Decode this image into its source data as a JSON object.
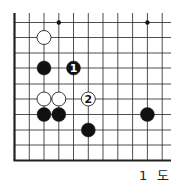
{
  "diagram": {
    "type": "go-board-fragment",
    "caption": "1 도",
    "grid": {
      "col_x": [
        14.5,
        29.3,
        44,
        58.8,
        73.5,
        88.3,
        103,
        117.8,
        132.6,
        147.4,
        162.2
      ],
      "row_y": [
        22.5,
        37.5,
        53,
        68,
        84,
        99,
        114.5,
        130,
        145,
        160.5
      ],
      "top_open_y": 13,
      "right_open_x": 171,
      "left_edge_x": 14.5,
      "bottom_edge_y": 160.5,
      "line_color": "#222222",
      "edge_width": 2.2,
      "line_width": 0.8
    },
    "star_points": [
      {
        "col": 3,
        "row": 0
      },
      {
        "col": 9,
        "row": 0
      }
    ],
    "stones": [
      {
        "color": "white",
        "col": 2,
        "row": 1,
        "label": ""
      },
      {
        "color": "black",
        "col": 2,
        "row": 3,
        "label": ""
      },
      {
        "color": "black",
        "col": 4,
        "row": 3,
        "label": "1"
      },
      {
        "color": "white",
        "col": 2,
        "row": 5,
        "label": ""
      },
      {
        "color": "white",
        "col": 3,
        "row": 5,
        "label": ""
      },
      {
        "color": "white",
        "col": 5,
        "row": 5,
        "label": "2"
      },
      {
        "color": "black",
        "col": 2,
        "row": 6,
        "label": ""
      },
      {
        "color": "black",
        "col": 3,
        "row": 6,
        "label": ""
      },
      {
        "color": "black",
        "col": 9,
        "row": 6,
        "label": ""
      },
      {
        "color": "black",
        "col": 5,
        "row": 7,
        "label": ""
      }
    ],
    "stone_radius": 7,
    "colors": {
      "black": "#111111",
      "white": "#ffffff",
      "outline": "#222222"
    }
  }
}
